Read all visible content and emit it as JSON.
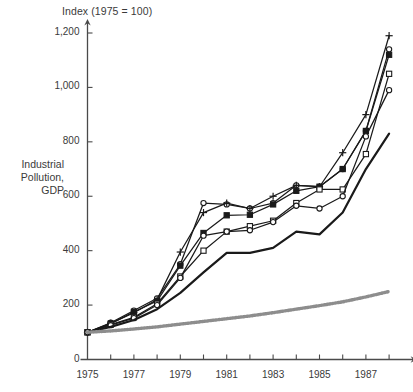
{
  "chart_data": {
    "type": "line",
    "title": "Index (1975 = 100)",
    "ylabel": "Industrial Pollution, GDP",
    "ylabel_lines": [
      "Industrial",
      "Pollution,",
      "GDP"
    ],
    "xlabel": "",
    "grid": false,
    "legend": "none",
    "xlim": [
      1975,
      1988
    ],
    "ylim": [
      0,
      1200
    ],
    "ytick_labels": [
      "0",
      "200",
      "400",
      "600",
      "800",
      "1,000",
      "1,200"
    ],
    "ytick_values": [
      0,
      200,
      400,
      600,
      800,
      1000,
      1200
    ],
    "xtick_labels": [
      "1975",
      "1977",
      "1979",
      "1981",
      "1983",
      "1985",
      "1987"
    ],
    "xtick_values": [
      1975,
      1977,
      1979,
      1981,
      1983,
      1985,
      1987
    ],
    "x_minor_ticks": [
      1976,
      1978,
      1980,
      1982,
      1984,
      1986,
      1988
    ],
    "x": [
      1975,
      1976,
      1977,
      1978,
      1979,
      1980,
      1981,
      1982,
      1983,
      1984,
      1985,
      1986,
      1987,
      1988
    ],
    "series": [
      {
        "name": "series-open-circle",
        "marker": "open-circle",
        "line": "thin",
        "values": [
          100,
          135,
          180,
          225,
          350,
          575,
          570,
          555,
          575,
          640,
          635,
          700,
          840,
          1140
        ]
      },
      {
        "name": "series-cross",
        "marker": "cross",
        "line": "thin",
        "values": [
          100,
          133,
          172,
          220,
          395,
          540,
          575,
          555,
          600,
          640,
          635,
          760,
          900,
          1190
        ]
      },
      {
        "name": "series-filled-square",
        "marker": "filled-square",
        "line": "thin",
        "values": [
          100,
          132,
          175,
          215,
          345,
          465,
          530,
          532,
          570,
          620,
          635,
          700,
          840,
          1120
        ]
      },
      {
        "name": "series-open-square",
        "marker": "open-square",
        "line": "thin",
        "values": [
          100,
          128,
          155,
          205,
          305,
          400,
          470,
          490,
          510,
          575,
          625,
          625,
          755,
          1050
        ]
      },
      {
        "name": "series-open-circle-lower",
        "marker": "open-circle",
        "line": "thin",
        "values": [
          100,
          126,
          152,
          200,
          300,
          455,
          470,
          475,
          505,
          565,
          555,
          600,
          820,
          990
        ]
      },
      {
        "name": "series-solid-no-marker",
        "marker": "none",
        "line": "thick",
        "values": [
          100,
          120,
          145,
          185,
          245,
          320,
          392,
          392,
          410,
          470,
          460,
          540,
          700,
          830
        ]
      },
      {
        "name": "series-gdp-stippled",
        "marker": "none",
        "line": "stippled",
        "values": [
          100,
          105,
          112,
          120,
          130,
          140,
          150,
          160,
          172,
          185,
          198,
          212,
          230,
          250
        ]
      }
    ]
  },
  "axes": {
    "arrow_x": true,
    "arrow_y": true
  }
}
